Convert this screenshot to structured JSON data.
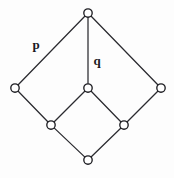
{
  "diagram": {
    "type": "hasse-lattice-diagram",
    "canvas": {
      "width": 174,
      "height": 178
    },
    "style": {
      "background_color": "#fdfdfd",
      "edge_color": "#2a2a2f",
      "node_stroke_color": "#1d1d22",
      "node_fill_color": "#ffffff",
      "label_color": "#1a1a1f",
      "node_radius": 4.2,
      "edge_width": 1.25
    },
    "nodes": [
      {
        "id": "top",
        "x": 88,
        "y": 13,
        "name": "node-top"
      },
      {
        "id": "left",
        "x": 15,
        "y": 88,
        "name": "node-left"
      },
      {
        "id": "center",
        "x": 88,
        "y": 88,
        "name": "node-center"
      },
      {
        "id": "right",
        "x": 161,
        "y": 88,
        "name": "node-right"
      },
      {
        "id": "lower-left",
        "x": 51,
        "y": 125,
        "name": "node-lower-left"
      },
      {
        "id": "lower-right",
        "x": 124,
        "y": 125,
        "name": "node-lower-right"
      },
      {
        "id": "bottom",
        "x": 88,
        "y": 160,
        "name": "node-bottom"
      }
    ],
    "edges": [
      {
        "id": "top-left",
        "from": "top",
        "to": "left",
        "label": "p"
      },
      {
        "id": "top-center",
        "from": "top",
        "to": "center",
        "label": "q"
      },
      {
        "id": "top-right",
        "from": "top",
        "to": "right",
        "label": ""
      },
      {
        "id": "left-lowerleft",
        "from": "left",
        "to": "lower-left",
        "label": ""
      },
      {
        "id": "center-lowerleft",
        "from": "center",
        "to": "lower-left",
        "label": ""
      },
      {
        "id": "center-lowerright",
        "from": "center",
        "to": "lower-right",
        "label": ""
      },
      {
        "id": "right-lowerright",
        "from": "right",
        "to": "lower-right",
        "label": ""
      },
      {
        "id": "lowerleft-bottom",
        "from": "lower-left",
        "to": "bottom",
        "label": ""
      },
      {
        "id": "lowerright-bottom",
        "from": "lower-right",
        "to": "bottom",
        "label": ""
      }
    ],
    "labels": [
      {
        "id": "label-p",
        "text": "p",
        "x": 36,
        "y": 44,
        "edge": "top-left",
        "name": "edge-label-p"
      },
      {
        "id": "label-q",
        "text": "q",
        "x": 97,
        "y": 60,
        "edge": "top-center",
        "name": "edge-label-q"
      }
    ]
  }
}
